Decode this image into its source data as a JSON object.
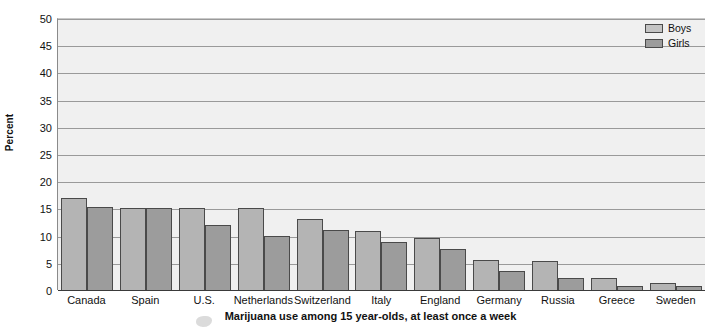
{
  "chart_data": {
    "type": "bar",
    "title": "Marijuana use among 15 year-olds, at least once a week",
    "xlabel": "",
    "ylabel": "Percent",
    "ylim": [
      0,
      50
    ],
    "yticks": [
      0,
      5,
      10,
      15,
      20,
      25,
      30,
      35,
      40,
      45,
      50
    ],
    "grid": true,
    "legend_position": "top-right",
    "categories": [
      "Canada",
      "Spain",
      "U.S.",
      "Netherlands",
      "Switzerland",
      "Italy",
      "England",
      "Germany",
      "Russia",
      "Greece",
      "Sweden"
    ],
    "series": [
      {
        "name": "Boys",
        "color": "#b4b4b4",
        "values": [
          17.0,
          15.1,
          15.0,
          15.0,
          13.0,
          10.8,
          9.5,
          5.5,
          5.4,
          2.3,
          1.2
        ]
      },
      {
        "name": "Girls",
        "color": "#9c9c9c",
        "values": [
          15.2,
          15.1,
          12.0,
          10.0,
          11.0,
          8.8,
          7.5,
          3.5,
          2.3,
          0.8,
          0.7
        ]
      }
    ]
  },
  "legend": {
    "items": [
      {
        "label": "Boys"
      },
      {
        "label": "Girls"
      }
    ]
  }
}
